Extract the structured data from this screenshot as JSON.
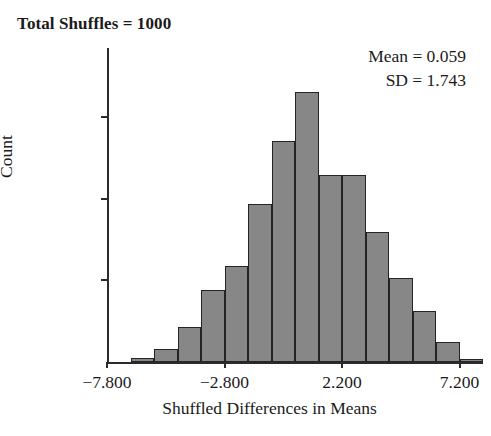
{
  "title": "Total Shuffles = 1000",
  "annotation": {
    "mean_line": "Mean = 0.059",
    "sd_line": "SD = 1.743"
  },
  "axes": {
    "ylabel": "Count",
    "xlabel": "Shuffled Differences in Means",
    "ytick_labels": [
      "173.7",
      "115.8",
      "57.9"
    ],
    "xtick_labels": [
      "−7.800",
      "−2.800",
      "2.200",
      "7.200"
    ]
  },
  "colors": {
    "bar_fill": "#878787",
    "bar_stroke": "#242424",
    "axis": "#2b2b2b",
    "text": "#1a1a1a",
    "background": "#ffffff"
  },
  "chart_data": {
    "type": "bar",
    "title": "Total Shuffles = 1000",
    "xlabel": "Shuffled Differences in Means",
    "ylabel": "Count",
    "xlim": [
      -7.8,
      8.2
    ],
    "ylim": [
      0,
      223
    ],
    "grid": false,
    "legend": false,
    "bin_width": 1.0,
    "tick_values_x": [
      -7.8,
      -2.8,
      2.2,
      7.2
    ],
    "tick_values_y": [
      57.9,
      115.8,
      173.7
    ],
    "statistics": {
      "total_shuffles": 1000,
      "mean": 0.059,
      "sd": 1.743
    },
    "bin_starts": [
      -7.8,
      -6.8,
      -5.8,
      -4.8,
      -3.8,
      -2.8,
      -1.8,
      -0.8,
      0.2,
      1.2,
      2.2,
      3.2,
      4.2,
      5.2,
      6.2,
      7.2
    ],
    "bin_centers": [
      -7.3,
      -6.3,
      -5.3,
      -4.3,
      -3.3,
      -2.3,
      -1.3,
      -0.3,
      0.7,
      1.7,
      2.7,
      3.7,
      4.7,
      5.7,
      6.7,
      7.7
    ],
    "categories": [
      "-7.8",
      "-6.8",
      "-5.8",
      "-4.8",
      "-3.8",
      "-2.8",
      "-1.8",
      "-0.8",
      "0.2",
      "1.2",
      "2.2",
      "3.2",
      "4.2",
      "5.2",
      "6.2",
      "7.2"
    ],
    "values": [
      0,
      3,
      9,
      25,
      51,
      68,
      112,
      157,
      192,
      133,
      133,
      92,
      60,
      36,
      14,
      2
    ]
  }
}
